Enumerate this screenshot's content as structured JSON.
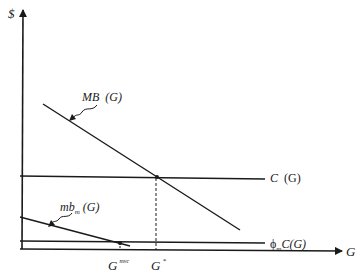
{
  "diagram": {
    "type": "economics-line-diagram",
    "y_axis_label": "$",
    "x_axis_label": "G",
    "curves": [
      {
        "id": "mb",
        "label_main": "MB",
        "label_arg": "(G)",
        "description": "downward sloping marginal benefit"
      },
      {
        "id": "c",
        "label_main": "C",
        "label_arg": "(G)",
        "description": "horizontal cost line"
      },
      {
        "id": "mbm",
        "label_main": "mb",
        "label_sub": "m",
        "label_arg": "(G)",
        "description": "downward sloping individual marginal benefit"
      },
      {
        "id": "phic",
        "label_prefix": "ϕ",
        "label_sub": "m",
        "label_main": "C(G)",
        "description": "horizontal scaled cost line"
      }
    ],
    "points": [
      {
        "id": "g-star",
        "label": "G",
        "superscript": "*"
      },
      {
        "id": "g-mvc",
        "label": "G",
        "superscript": "mvc"
      }
    ],
    "colors": {
      "line": "#1a1a1a",
      "background": "#ffffff"
    }
  }
}
